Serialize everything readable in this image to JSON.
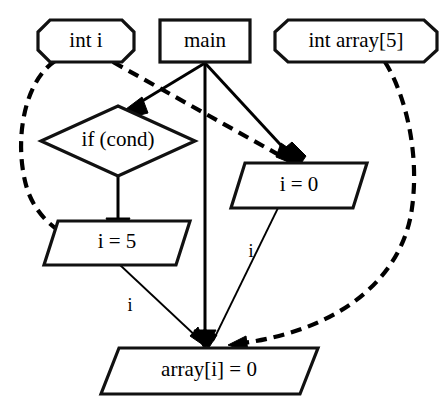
{
  "diagram": {
    "type": "flowchart",
    "background_color": "#ffffff",
    "stroke_color": "#000000",
    "nodes": [
      {
        "id": "int-i",
        "label": "int i",
        "shape": "octagon",
        "x": 86,
        "y": 41,
        "width": 98,
        "height": 44
      },
      {
        "id": "main",
        "label": "main",
        "shape": "rectangle",
        "x": 205,
        "y": 41,
        "width": 92,
        "height": 44
      },
      {
        "id": "int-array",
        "label": "int array[5]",
        "shape": "octagon",
        "x": 356,
        "y": 41,
        "width": 164,
        "height": 44
      },
      {
        "id": "if-cond",
        "label": "if (cond)",
        "shape": "diamond",
        "x": 118,
        "y": 141,
        "width": 154,
        "height": 70
      },
      {
        "id": "i-eq-0",
        "label": "i = 0",
        "shape": "parallelogram",
        "x": 299,
        "y": 185,
        "width": 136,
        "height": 44
      },
      {
        "id": "i-eq-5",
        "label": "i = 5",
        "shape": "parallelogram",
        "x": 117,
        "y": 242,
        "width": 146,
        "height": 44
      },
      {
        "id": "array-i-eq-0",
        "label": "array[i] = 0",
        "shape": "parallelogram",
        "x": 209,
        "y": 371,
        "width": 218,
        "height": 46
      }
    ],
    "edges": [
      {
        "id": "main-to-if",
        "from": "main",
        "to": "if-cond",
        "style": "solid",
        "arrow": true,
        "label": ""
      },
      {
        "id": "main-to-i0",
        "from": "main",
        "to": "i-eq-0",
        "style": "solid",
        "arrow": true,
        "label": ""
      },
      {
        "id": "main-to-arrayi",
        "from": "main",
        "to": "array-i-eq-0",
        "style": "solid",
        "arrow": true,
        "label": ""
      },
      {
        "id": "if-to-i5",
        "from": "if-cond",
        "to": "i-eq-5",
        "style": "solid",
        "arrow": true,
        "label": ""
      },
      {
        "id": "inti-to-i5",
        "from": "int-i",
        "to": "i-eq-5",
        "style": "dashed",
        "arrow": true,
        "label": ""
      },
      {
        "id": "inti-to-i0",
        "from": "int-i",
        "to": "i-eq-0",
        "style": "dashed",
        "arrow": true,
        "label": ""
      },
      {
        "id": "intarray-to-arrayi",
        "from": "int-array",
        "to": "array-i-eq-0",
        "style": "dashed",
        "arrow": true,
        "label": ""
      },
      {
        "id": "i5-to-arrayi",
        "from": "i-eq-5",
        "to": "array-i-eq-0",
        "style": "thin",
        "arrow": true,
        "label": "i"
      },
      {
        "id": "i0-to-arrayi",
        "from": "i-eq-0",
        "to": "array-i-eq-0",
        "style": "thin",
        "arrow": true,
        "label": "i"
      }
    ],
    "edge_labels": [
      {
        "id": "label-i-left",
        "text": "i",
        "x": 130,
        "y": 307
      },
      {
        "id": "label-i-right",
        "text": "i",
        "x": 251,
        "y": 253
      }
    ]
  }
}
